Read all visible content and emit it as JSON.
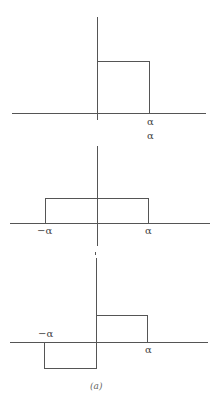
{
  "figure": {
    "caption": "(a)",
    "panels": [
      {
        "name": "top",
        "description": "rectangular pulse from 0 to alpha",
        "labels": {
          "right": "α",
          "right_below": "α"
        }
      },
      {
        "name": "middle",
        "description": "rectangular pulse from -alpha to alpha",
        "labels": {
          "left": "−α",
          "right": "α"
        }
      },
      {
        "name": "bottom",
        "description": "odd pulse: negative from -alpha to 0, positive from 0 to alpha",
        "labels": {
          "left": "−α",
          "right": "α"
        }
      }
    ]
  }
}
